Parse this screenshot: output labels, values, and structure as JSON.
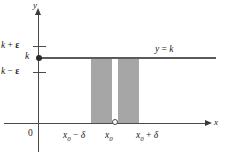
{
  "figure": {
    "kind": "epsilon-delta-limit-diagram",
    "caption_text": "",
    "axes": {
      "y_axis_label": "y",
      "x_axis_label": "x",
      "origin_label": "0"
    },
    "y_ticks": [
      {
        "id": "k-plus-epsilon",
        "label": "k + ε",
        "value": "k + ε"
      },
      {
        "id": "k",
        "label": "k",
        "value": "k"
      },
      {
        "id": "k-minus-epsilon",
        "label": "k − ε",
        "value": "k − ε"
      }
    ],
    "x_ticks": [
      {
        "id": "x0-minus-delta",
        "label": "x₀ − δ"
      },
      {
        "id": "x0",
        "label": "x₀"
      },
      {
        "id": "x0-plus-delta",
        "label": "x₀ + δ"
      }
    ],
    "curve_label": "y = k",
    "shaded_region": {
      "description": "punctured delta-neighborhood band",
      "color": "#a6a6a6"
    },
    "colors": {
      "axis": "#4a4a4a",
      "line": "#5a5a5a",
      "shade": "#a6a6a6",
      "text": "#1a1a1a",
      "background": "#ffffff"
    }
  },
  "chart_data": {
    "type": "line",
    "title": "",
    "xlabel": "x",
    "ylabel": "y",
    "series": [
      {
        "name": "y = k",
        "x": [
          0,
          1
        ],
        "values": [
          "k",
          "k"
        ]
      }
    ],
    "annotations": [
      "k + ε",
      "k",
      "k − ε",
      "x₀ − δ",
      "x₀",
      "x₀ + δ",
      "y = k",
      "0"
    ],
    "grid": false,
    "legend": "none"
  }
}
